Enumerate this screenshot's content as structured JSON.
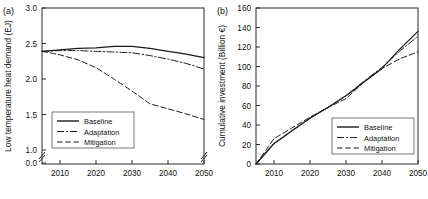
{
  "figure": {
    "panels": [
      {
        "tag": "(a)",
        "ylabel": "Low temperature heat demand (EJ)",
        "xlabel": "",
        "ytick_labels": [
          "0.0",
          "1.0",
          "1.5",
          "2.0",
          "2.5",
          "3.0"
        ],
        "xtick_labels": [
          "2010",
          "2020",
          "2030",
          "2040",
          "2050"
        ],
        "axis_break": "yes",
        "legend": [
          {
            "label": "Baseline",
            "style": "solid"
          },
          {
            "label": "Adaptation",
            "style": "dashdot"
          },
          {
            "label": "Mitigation",
            "style": "dashed"
          }
        ]
      },
      {
        "tag": "(b)",
        "ylabel": "Cumulative investment (Billion €)",
        "xlabel": "",
        "ytick_labels": [
          "0",
          "20",
          "40",
          "60",
          "80",
          "100",
          "120",
          "140",
          "160"
        ],
        "xtick_labels": [
          "2010",
          "2020",
          "2030",
          "2040",
          "2050"
        ],
        "axis_break": "no",
        "legend": [
          {
            "label": "Baseline",
            "style": "solid"
          },
          {
            "label": "Adaptation",
            "style": "dashdot"
          },
          {
            "label": "Mitigation",
            "style": "dashed"
          }
        ]
      }
    ]
  },
  "chart_data": [
    {
      "type": "line",
      "title": "(a) Low temperature heat demand",
      "xlabel": "",
      "ylabel": "Low temperature heat demand (EJ)",
      "xlim": [
        2005,
        2050
      ],
      "ylim": [
        1.0,
        3.0
      ],
      "y_axis_break_below": 1.0,
      "ytick_values": [
        0.0,
        1.0,
        1.5,
        2.0,
        2.5,
        3.0
      ],
      "xtick_values": [
        2010,
        2020,
        2030,
        2040,
        2050
      ],
      "grid": false,
      "legend_position": "lower-left",
      "x": [
        2005,
        2010,
        2015,
        2020,
        2025,
        2030,
        2035,
        2040,
        2045,
        2050
      ],
      "series": [
        {
          "name": "Baseline",
          "style": "solid",
          "values": [
            2.39,
            2.41,
            2.43,
            2.44,
            2.46,
            2.46,
            2.43,
            2.39,
            2.35,
            2.3
          ]
        },
        {
          "name": "Adaptation",
          "style": "dashdot",
          "values": [
            2.39,
            2.4,
            2.4,
            2.39,
            2.38,
            2.37,
            2.33,
            2.28,
            2.22,
            2.14
          ]
        },
        {
          "name": "Mitigation",
          "style": "dashed",
          "values": [
            2.39,
            2.34,
            2.27,
            2.16,
            2.0,
            1.83,
            1.65,
            1.58,
            1.51,
            1.43
          ]
        }
      ]
    },
    {
      "type": "line",
      "title": "(b) Cumulative investment",
      "xlabel": "",
      "ylabel": "Cumulative investment (Billion €)",
      "xlim": [
        2005,
        2050
      ],
      "ylim": [
        0,
        160
      ],
      "ytick_values": [
        0,
        20,
        40,
        60,
        80,
        100,
        120,
        140,
        160
      ],
      "xtick_values": [
        2010,
        2020,
        2030,
        2040,
        2050
      ],
      "grid": false,
      "legend_position": "lower-right",
      "x": [
        2005,
        2010,
        2015,
        2020,
        2025,
        2030,
        2035,
        2040,
        2045,
        2050
      ],
      "series": [
        {
          "name": "Baseline",
          "style": "solid",
          "values": [
            0,
            21,
            34,
            47,
            58,
            70,
            84,
            98,
            118,
            136
          ]
        },
        {
          "name": "Adaptation",
          "style": "dashdot",
          "values": [
            0,
            21,
            34,
            47,
            58,
            70,
            85,
            99,
            116,
            131
          ]
        },
        {
          "name": "Mitigation",
          "style": "dashed",
          "values": [
            0,
            26,
            37,
            48,
            58,
            67,
            84,
            98,
            108,
            115
          ]
        }
      ]
    }
  ]
}
